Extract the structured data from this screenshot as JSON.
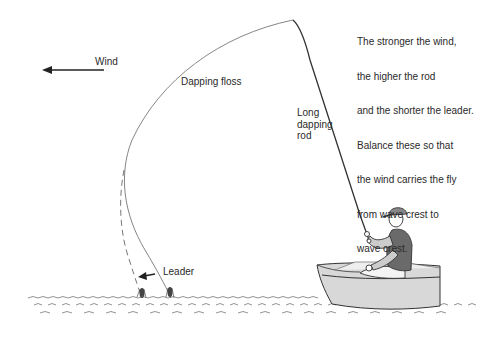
{
  "diagram": {
    "note_lines": [
      "The stronger the wind,",
      "the higher the rod",
      "and the shorter the leader.",
      "Balance these so that",
      "the wind carries the fly",
      "from wave crest to",
      "wave crest."
    ],
    "labels": {
      "wind": "Wind",
      "dapping_floss": "Dapping floss",
      "long_dapping_rod": "Long\ndapping\nrod",
      "leader": "Leader"
    },
    "colors": {
      "ink": "#2a2a2a",
      "line": "#555555",
      "boat_shade": "#d8d8d8",
      "vest": "#6a6a6a",
      "background": "#ffffff"
    }
  }
}
